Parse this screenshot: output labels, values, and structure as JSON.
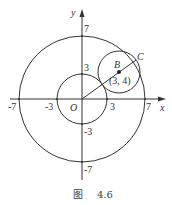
{
  "figure": {
    "caption_prefix": "图",
    "caption_number": "4.6",
    "axes": {
      "x_label": "x",
      "y_label": "y",
      "origin_label": "O"
    },
    "x_ticks": [
      "-7",
      "-3",
      "3",
      "7"
    ],
    "y_ticks": [
      "7",
      "3",
      "-3",
      "-7"
    ],
    "circles": [
      {
        "name": "outer",
        "center": [
          0,
          0
        ],
        "radius": 7
      },
      {
        "name": "inner",
        "center": [
          0,
          0
        ],
        "radius": 3
      },
      {
        "name": "circle-B",
        "center": [
          3,
          4
        ],
        "radius": 2
      }
    ],
    "points": {
      "B": {
        "label": "B",
        "coord_label": "(3, 4)"
      },
      "C": {
        "label": "C"
      }
    },
    "stroke_color": "#333333"
  }
}
